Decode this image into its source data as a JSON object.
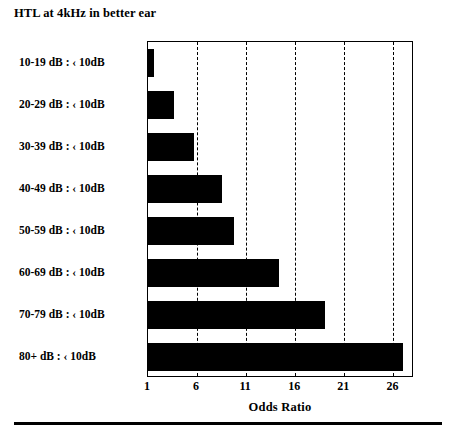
{
  "chart_data": {
    "type": "bar",
    "orientation": "horizontal",
    "title": "HTL at 4kHz in better ear",
    "xlabel": "Odds Ratio",
    "ylabel": "",
    "categories": [
      "10-19 dB : ‹ 10dB",
      "20-29 dB : ‹ 10dB",
      "30-39 dB : ‹ 10dB",
      "40-49 dB : ‹ 10dB",
      "50-59 dB : ‹ 10dB",
      "60-69 dB : ‹ 10dB",
      "70-79 dB : ‹ 10dB",
      "80+  dB : ‹ 10dB"
    ],
    "values": [
      1.6,
      3.6,
      5.7,
      8.5,
      9.8,
      14.3,
      19.0,
      27.0
    ],
    "xticks": [
      1,
      6,
      11,
      16,
      21,
      26
    ],
    "xlim": [
      1,
      28.1
    ],
    "grid": true,
    "gridline_style": "dashed-vertical",
    "legend": false,
    "bar_color": "#000000",
    "frame_color": "#000000",
    "background": "#ffffff"
  }
}
